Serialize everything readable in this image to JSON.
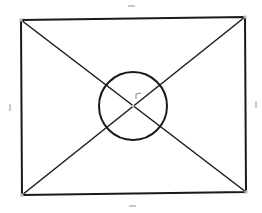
{
  "diagram": {
    "width": 262,
    "height": 213,
    "background": "#ffffff",
    "stroke_color": "#1a1a1a",
    "handle_color": "#b8b8b8",
    "rectangle": {
      "top_left": [
        21,
        20
      ],
      "top_right": [
        245,
        17
      ],
      "bottom_right": [
        246,
        192
      ],
      "bottom_left": [
        22,
        195
      ]
    },
    "diagonals": [
      {
        "from": [
          21,
          20
        ],
        "to": [
          246,
          192
        ]
      },
      {
        "from": [
          245,
          17
        ],
        "to": [
          22,
          195
        ]
      }
    ],
    "circle": {
      "cx": 133,
      "cy": 106,
      "r": 34
    },
    "center_point": [
      133,
      106
    ],
    "angle_marker": {
      "x": 136,
      "y": 94
    },
    "edge_handles": {
      "top": {
        "x1": 128,
        "y1": 6,
        "x2": 135,
        "y2": 6
      },
      "bottom": {
        "x1": 129,
        "y1": 206,
        "x2": 136,
        "y2": 206
      },
      "left": {
        "x1": 10,
        "y1": 104,
        "x2": 10,
        "y2": 111
      },
      "right": {
        "x1": 256,
        "y1": 101,
        "x2": 256,
        "y2": 108
      }
    }
  }
}
